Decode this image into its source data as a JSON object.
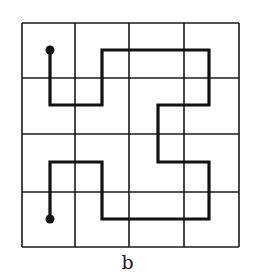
{
  "figure": {
    "caption": "b",
    "grid": {
      "rows": 4,
      "cols": 4,
      "x_lines": [
        22,
        75,
        129,
        184,
        239
      ],
      "y_lines": [
        23,
        78,
        134,
        192,
        247
      ],
      "line_color": "#1a1a1a",
      "line_width": 1.6
    },
    "path": {
      "description": "Space-filling path through 4x4 grid cell centers",
      "cells": [
        [
          0,
          0
        ],
        [
          0,
          1
        ],
        [
          1,
          1
        ],
        [
          1,
          0
        ],
        [
          2,
          0
        ],
        [
          3,
          0
        ],
        [
          3,
          1
        ],
        [
          2,
          1
        ],
        [
          2,
          2
        ],
        [
          3,
          2
        ],
        [
          3,
          3
        ],
        [
          2,
          3
        ],
        [
          1,
          3
        ],
        [
          1,
          2
        ],
        [
          0,
          2
        ],
        [
          0,
          3
        ]
      ],
      "points": [
        [
          50,
          50
        ],
        [
          50,
          105
        ],
        [
          102,
          105
        ],
        [
          102,
          50
        ],
        [
          158,
          50
        ],
        [
          209,
          50
        ],
        [
          209,
          105
        ],
        [
          158,
          105
        ],
        [
          158,
          162
        ],
        [
          209,
          162
        ],
        [
          209,
          219
        ],
        [
          158,
          219
        ],
        [
          102,
          219
        ],
        [
          102,
          162
        ],
        [
          50,
          162
        ],
        [
          50,
          219
        ]
      ],
      "color": "#111111",
      "width": 3.2,
      "endpoint_radius": 4.5
    }
  }
}
